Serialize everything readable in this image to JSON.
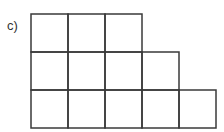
{
  "label": "c)",
  "grid": {
    "left": 31,
    "top": 14,
    "cell_w": 37,
    "cell_h": 38,
    "row_lengths": [
      3,
      4,
      5
    ],
    "stroke": "#3a3a3a"
  }
}
